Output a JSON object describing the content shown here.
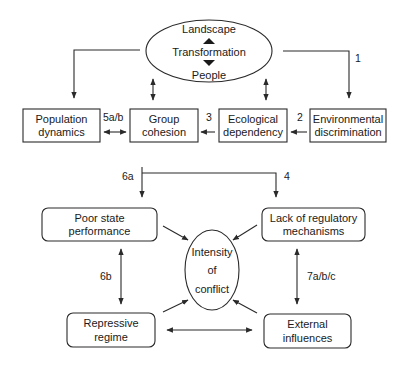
{
  "diagram": {
    "center_top": {
      "lines": [
        "Landscape",
        "Transformation",
        "People"
      ],
      "arrows_between": [
        "up-triangle",
        "down-triangle"
      ]
    },
    "nodes": {
      "population_dynamics": {
        "lines": [
          "Population",
          "dynamics"
        ]
      },
      "group_cohesion": {
        "lines": [
          "Group",
          "cohesion"
        ]
      },
      "ecological_dependency": {
        "lines": [
          "Ecological",
          "dependency"
        ]
      },
      "environmental_discrimination": {
        "lines": [
          "Environmental",
          "discrimination"
        ]
      },
      "poor_state_performance": {
        "lines": [
          "Poor state",
          "performance"
        ]
      },
      "lack_of_regulatory": {
        "lines": [
          "Lack of regulatory",
          "mechanisms"
        ]
      },
      "intensity_of_conflict": {
        "lines": [
          "Intensity",
          "of",
          "conflict"
        ]
      },
      "repressive_regime": {
        "lines": [
          "Repressive",
          "regime"
        ]
      },
      "external_influences": {
        "lines": [
          "External",
          "influences"
        ]
      }
    },
    "edge_labels": {
      "e1": "1",
      "e2": "2",
      "e3": "3",
      "e4": "4",
      "e5": "5a/b",
      "e6a": "6a",
      "e6b": "6b",
      "e7": "7a/b/c"
    },
    "colors": {
      "stroke": "#2a2a2a",
      "text": "#1a1a1a",
      "background": "#ffffff"
    }
  }
}
